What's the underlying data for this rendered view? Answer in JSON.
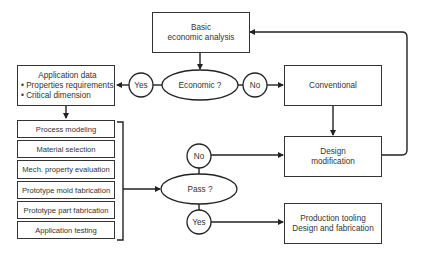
{
  "diagram": {
    "nodes": {
      "basic_analysis": {
        "line1": "Basic",
        "line2": "economic analysis"
      },
      "economic_decision": {
        "label": "Economic ?"
      },
      "economic_yes": {
        "label": "Yes"
      },
      "economic_no": {
        "label": "No"
      },
      "conventional": {
        "label": "Conventional"
      },
      "application_data": {
        "title": "Application data",
        "bullets": [
          "• Properties requirements",
          "• Critical dimension"
        ]
      },
      "process_steps": [
        "Process modeling",
        "Material selection",
        "Mech. property evaluation",
        "Prototype mold fabrication",
        "Prototype part fabrication",
        "Application testing"
      ],
      "pass_decision": {
        "label": "Pass ?"
      },
      "pass_no": {
        "label": "No"
      },
      "pass_yes": {
        "label": "Yes"
      },
      "design_modification": {
        "line1": "Design",
        "line2": "modification"
      },
      "production_tooling": {
        "line1": "Production tooling",
        "line2": "Design and fabrication"
      }
    },
    "colors": {
      "stroke": "#333333",
      "background": "#ffffff",
      "text": "#333333"
    }
  }
}
